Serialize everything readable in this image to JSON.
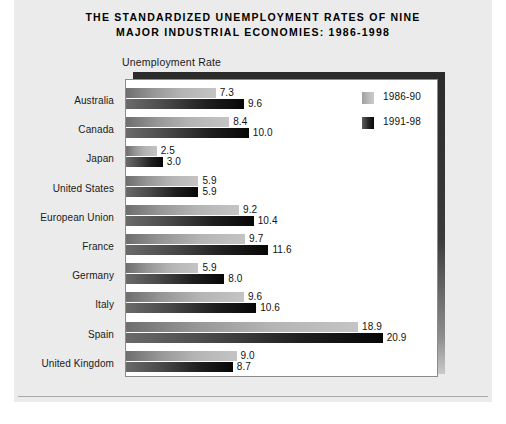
{
  "title": {
    "line1": "THE STANDARDIZED UNEMPLOYMENT RATES OF NINE",
    "line2": "MAJOR INDUSTRIAL ECONOMIES: 1986-1998"
  },
  "axis_caption": "Unemployment Rate",
  "legend": {
    "position": "top-right-inside-plot",
    "entries": [
      {
        "label": "1986-90",
        "swatch": "light-gray-gradient-swatch",
        "color": "#b9b9b9"
      },
      {
        "label": "1991-98",
        "swatch": "dark-gradient-swatch",
        "color": "#1a1a1a"
      }
    ]
  },
  "chart_data": {
    "type": "bar",
    "orientation": "horizontal",
    "title": "THE STANDARDIZED UNEMPLOYMENT RATES OF NINE MAJOR INDUSTRIAL ECONOMIES: 1986-1998",
    "xlabel": "Unemployment Rate",
    "ylabel": "",
    "grid": false,
    "legend_position": "top-right",
    "xlim": [
      0,
      25.4
    ],
    "categories": [
      "Australia",
      "Canada",
      "Japan",
      "United States",
      "European Union",
      "France",
      "Germany",
      "Italy",
      "Spain",
      "United Kingdom"
    ],
    "series": [
      {
        "name": "1986-90",
        "color": "#b9b9b9",
        "values": [
          7.3,
          8.4,
          2.5,
          5.9,
          9.2,
          9.7,
          5.9,
          9.6,
          18.9,
          9.0
        ],
        "labels": [
          "7.3",
          "8.4",
          "2.5",
          "5.9",
          "9.2",
          "9.7",
          "5.9",
          "9.6",
          "18.9",
          "9.0"
        ]
      },
      {
        "name": "1991-98",
        "color": "#1a1a1a",
        "values": [
          9.6,
          10.0,
          3.0,
          5.9,
          10.4,
          11.6,
          8.0,
          10.6,
          20.9,
          8.7
        ],
        "labels": [
          "9.6",
          "10.0",
          "3.0",
          "5.9",
          "10.4",
          "11.6",
          "8.0",
          "10.6",
          "20.9",
          "8.7"
        ]
      }
    ]
  }
}
